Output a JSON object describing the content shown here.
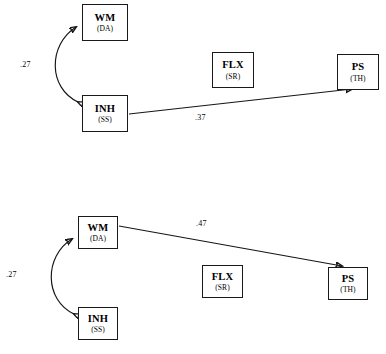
{
  "figure": {
    "type": "path-diagram",
    "background_color": "#ffffff",
    "line_color": "#151515",
    "panels": [
      {
        "id": "top-model",
        "nodes": [
          {
            "id": "wm",
            "title": "WM",
            "sub": "(DA)",
            "x": 82,
            "y": 4,
            "w": 46,
            "h": 37
          },
          {
            "id": "inh",
            "title": "INH",
            "sub": "(SS)",
            "x": 82,
            "y": 95,
            "w": 46,
            "h": 37
          },
          {
            "id": "flx",
            "title": "FLX",
            "sub": "(SR)",
            "x": 212,
            "y": 52,
            "w": 42,
            "h": 36
          },
          {
            "id": "ps",
            "title": "PS",
            "sub": "(TH)",
            "x": 337,
            "y": 54,
            "w": 42,
            "h": 36
          }
        ],
        "edges": [
          {
            "id": "wm-inh-covariance",
            "from": "inh",
            "to": "wm",
            "kind": "curved-double-headed",
            "label": ".27",
            "label_x": 20,
            "label_y": 60
          },
          {
            "id": "inh-ps-path",
            "from": "inh",
            "to": "ps",
            "kind": "straight-single-headed",
            "label": ".37",
            "label_x": 195,
            "label_y": 113
          }
        ]
      },
      {
        "id": "bottom-model",
        "nodes": [
          {
            "id": "wm2",
            "title": "WM",
            "sub": "(DA)",
            "x": 78,
            "y": 216,
            "w": 40,
            "h": 33
          },
          {
            "id": "inh2",
            "title": "INH",
            "sub": "(SS)",
            "x": 78,
            "y": 307,
            "w": 40,
            "h": 33
          },
          {
            "id": "flx2",
            "title": "FLX",
            "sub": "(SR)",
            "x": 202,
            "y": 265,
            "w": 41,
            "h": 33
          },
          {
            "id": "ps2",
            "title": "PS",
            "sub": "(TH)",
            "x": 328,
            "y": 267,
            "w": 40,
            "h": 33
          }
        ],
        "edges": [
          {
            "id": "wm-inh-covariance-2",
            "from": "inh2",
            "to": "wm2",
            "kind": "curved-double-headed",
            "label": ".27",
            "label_x": 6,
            "label_y": 270
          },
          {
            "id": "wm-ps-path",
            "from": "wm2",
            "to": "ps2",
            "kind": "straight-single-headed",
            "label": ".47",
            "label_x": 196,
            "label_y": 219
          }
        ]
      }
    ]
  }
}
